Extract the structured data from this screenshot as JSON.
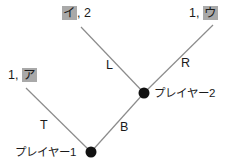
{
  "diagram": {
    "type": "game-tree",
    "title": "",
    "background_color": "#ffffff",
    "line_color": "#8c8c8c",
    "node_color": "#111111",
    "text_color": "#1a1a1a",
    "highlight_color": "#a9a9a9",
    "nodes": [
      {
        "id": "p1",
        "label": "プレイヤー1",
        "x": 91,
        "y": 152
      },
      {
        "id": "p2",
        "label": "プレイヤー2",
        "x": 144,
        "y": 93
      }
    ],
    "edges": [
      {
        "id": "T",
        "label": "T",
        "from": "p1",
        "to": "leaf-a",
        "x1": 91,
        "y1": 152,
        "x2": 26,
        "y2": 88
      },
      {
        "id": "B",
        "label": "B",
        "from": "p1",
        "to": "p2",
        "x1": 91,
        "y1": 152,
        "x2": 144,
        "y2": 93
      },
      {
        "id": "L",
        "label": "L",
        "from": "p2",
        "to": "leaf-i",
        "x1": 144,
        "y1": 93,
        "x2": 81,
        "y2": 27
      },
      {
        "id": "R",
        "label": "R",
        "from": "p2",
        "to": "leaf-u",
        "x1": 144,
        "y1": 93,
        "x2": 213,
        "y2": 25
      }
    ],
    "edge_labels": {
      "T": "T",
      "B": "B",
      "L": "L",
      "R": "R"
    },
    "payoffs": [
      {
        "id": "leaf-a",
        "first": "1,",
        "second": "ア",
        "highlight_second": true,
        "highlight_first": false
      },
      {
        "id": "leaf-i",
        "first": "イ",
        "second": ", 2",
        "highlight_second": false,
        "highlight_first": true
      },
      {
        "id": "leaf-u",
        "first": "1,",
        "second": "ウ",
        "highlight_second": true,
        "highlight_first": false
      }
    ]
  }
}
